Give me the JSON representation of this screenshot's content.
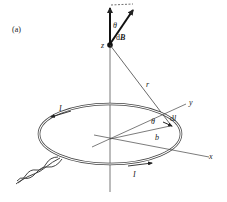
{
  "figure": {
    "panel_label": "(a)",
    "labels": {
      "z": "z",
      "theta_top": "θ",
      "dB_d": "d",
      "dB_B": "B",
      "r": "r",
      "y": "y",
      "x": "x",
      "theta_loop": "θ",
      "dl_d": "d",
      "dl_l": "l",
      "b": "b",
      "current_top": "I",
      "current_bottom": "I"
    },
    "colors": {
      "line": "#333333",
      "background": "#ffffff"
    }
  }
}
